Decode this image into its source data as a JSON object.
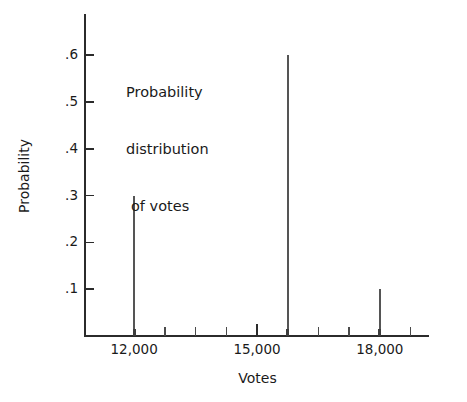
{
  "chart_data": {
    "type": "bar",
    "title": "",
    "annotation": [
      "Probability",
      "distribution",
      "of votes"
    ],
    "xlabel": "Votes",
    "ylabel": "Probability",
    "x": [
      12000,
      15750,
      18000
    ],
    "values": [
      0.3,
      0.6,
      0.1
    ],
    "categories": [
      "12,000",
      "15,750",
      "18,000"
    ],
    "xlim": [
      10800,
      19200
    ],
    "ylim": [
      0,
      0.66
    ],
    "grid": false,
    "legend": false,
    "xticks_major": [
      {
        "value": 12000,
        "label": "12,000"
      },
      {
        "value": 15000,
        "label": "15,000"
      },
      {
        "value": 18000,
        "label": "18,000"
      }
    ],
    "xticks_minor": [
      12750,
      13500,
      14250,
      15750,
      16500,
      17250,
      18750
    ],
    "yticks": [
      {
        "value": 0.1,
        "label": ".1"
      },
      {
        "value": 0.2,
        "label": ".2"
      },
      {
        "value": 0.3,
        "label": ".3"
      },
      {
        "value": 0.4,
        "label": ".4"
      },
      {
        "value": 0.5,
        "label": ".5"
      },
      {
        "value": 0.6,
        "label": ".6"
      }
    ],
    "colors": {
      "axis": "#2b2b2b",
      "spike": "#555555",
      "text": "#1a1a1a",
      "background": "#ffffff"
    }
  }
}
